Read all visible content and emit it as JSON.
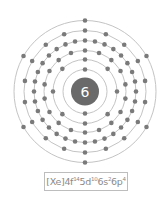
{
  "diagram": {
    "type": "bohr-model",
    "nucleus_label": "6",
    "center": [
      85,
      91.5
    ],
    "nucleus_radius": 14,
    "shell_radii": [
      22,
      32,
      41,
      51,
      61,
      71
    ],
    "shell_electrons": [
      2,
      8,
      18,
      32,
      18,
      6
    ],
    "electron_radius": 2.3,
    "colors": {
      "nucleus": "#6a6a6a",
      "nucleus_text": "#ffffff",
      "shell": "#c4c4c4",
      "electron": "#7a7a7a"
    }
  },
  "config": {
    "core": "[Xe]",
    "terms": [
      {
        "orbital": "4f",
        "count": "14"
      },
      {
        "orbital": "5d",
        "count": "10"
      },
      {
        "orbital": "6s",
        "count": "2"
      },
      {
        "orbital": "6p",
        "count": "4"
      }
    ]
  }
}
